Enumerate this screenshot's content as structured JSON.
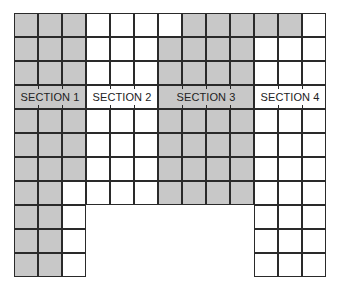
{
  "diagram": {
    "title": "",
    "grid": {
      "origin": [
        14,
        13
      ],
      "cell_size": 24,
      "columns": 13,
      "rows": 11,
      "label_row": 3,
      "colors": {
        "shaded": "#c8c8c8",
        "unshaded": "#ffffff",
        "line": "#2a2a2a"
      },
      "cells": [
        "SSSWWWWSSSSSW",
        "SSSWWWSSSSWWW",
        "SSSWWWSSSSWWW",
        "LLLLLLLLLLLLL",
        "SSSWWWSSSSWWW",
        "SSSWWWSSSSWWW",
        "SSSWWWSSSSWWW",
        "SSWWWWSSSSWWW",
        "SSW.......WWW",
        "SSW.......WWW",
        "SSW.......WWW"
      ]
    },
    "sections": [
      {
        "label": "SECTION 1",
        "col_start": 0,
        "col_span": 3,
        "shaded": true
      },
      {
        "label": "SECTION 2",
        "col_start": 3,
        "col_span": 3,
        "shaded": false
      },
      {
        "label": "SECTION 3",
        "col_start": 6,
        "col_span": 4,
        "shaded": true
      },
      {
        "label": "SECTION 4",
        "col_start": 10,
        "col_span": 3,
        "shaded": false
      }
    ]
  }
}
